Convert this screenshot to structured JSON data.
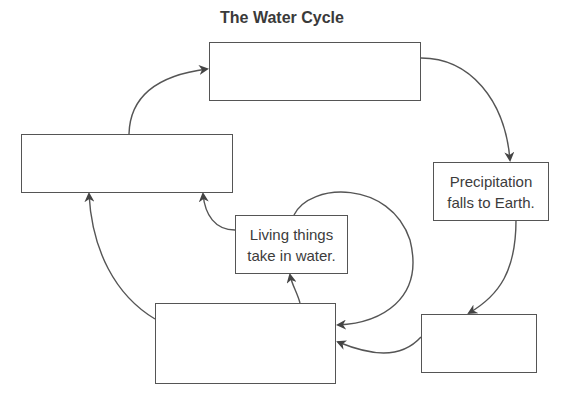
{
  "header": {
    "cutoff_text": "Study Guide Activities",
    "title": "The Water Cycle"
  },
  "diagram": {
    "boxes": [
      {
        "id": "top",
        "label": ""
      },
      {
        "id": "left",
        "label": ""
      },
      {
        "id": "precipitation",
        "label_line1": "Precipitation",
        "label_line2": "falls to Earth."
      },
      {
        "id": "living",
        "label_line1": "Living things",
        "label_line2": "take in water."
      },
      {
        "id": "bottom-center",
        "label": ""
      },
      {
        "id": "bottom-right",
        "label": ""
      }
    ],
    "arrows": [
      {
        "from": "left",
        "to": "top"
      },
      {
        "from": "top",
        "to": "precipitation"
      },
      {
        "from": "precipitation",
        "to": "bottom-right"
      },
      {
        "from": "bottom-right",
        "to": "bottom-center"
      },
      {
        "from": "bottom-center",
        "to": "left"
      },
      {
        "from": "bottom-center",
        "to": "living"
      },
      {
        "from": "living",
        "to": "left"
      },
      {
        "from": "living",
        "to": "bottom-center"
      }
    ],
    "colors": {
      "stroke": "#555555",
      "text": "#3c3c3c"
    }
  }
}
